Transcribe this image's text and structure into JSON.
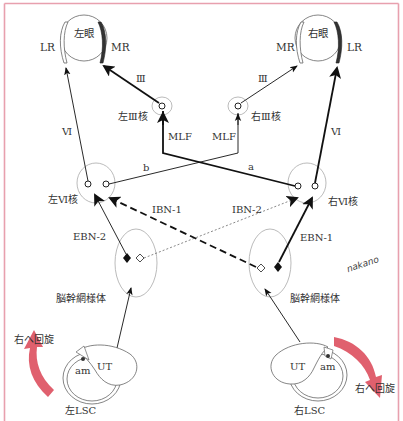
{
  "diagram": {
    "frame_color": "#e8a0ae",
    "arrow_color": "#e0606e",
    "eyes": {
      "left": {
        "label": "左眼",
        "lateral_muscle": "LR",
        "medial_muscle": "MR"
      },
      "right": {
        "label": "右眼",
        "lateral_muscle": "LR",
        "medial_muscle": "MR"
      }
    },
    "nuclei": {
      "left_III": "左Ⅲ核",
      "right_III": "右Ⅲ核",
      "left_VI": "左Ⅵ核",
      "right_VI": "右Ⅵ核"
    },
    "nerves": {
      "left_III_nerve": "Ⅲ",
      "right_III_nerve": "Ⅲ",
      "left_VI_nerve": "Ⅵ",
      "right_VI_nerve": "Ⅵ"
    },
    "pathways": {
      "mlf_left": "MLF",
      "mlf_right": "MLF",
      "b": "b",
      "a": "a",
      "ibn1": "IBN-1",
      "ibn2": "IBN-2",
      "ebn2": "EBN-2",
      "ebn1": "EBN-1"
    },
    "reticular_formation": {
      "left": "脳幹網様体",
      "right": "脳幹網様体"
    },
    "canals": {
      "left": {
        "label": "左LSC",
        "ut": "UT",
        "am": "am"
      },
      "right": {
        "label": "右LSC",
        "ut": "UT",
        "am": "am"
      }
    },
    "rotation": {
      "left": "右へ回旋",
      "right": "右へ回旋"
    },
    "signature": "nakano"
  }
}
